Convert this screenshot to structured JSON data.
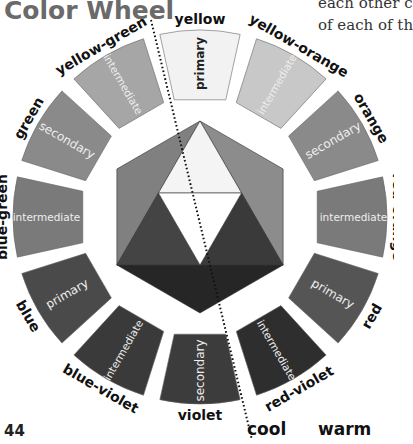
{
  "page": {
    "title": "Color Wheel",
    "corner_text": [
      "each other c",
      "of each of th"
    ],
    "page_number": "44",
    "cool_label": "cool",
    "warm_label": "warm"
  },
  "wheel": {
    "segments": [
      {
        "name": "yellow",
        "type": "primary",
        "fill": "#f2f2f2",
        "text_color": "#222222"
      },
      {
        "name": "yellow-orange",
        "type": "intermediate",
        "fill": "#c8c8c8",
        "text_color": "#eeeeee"
      },
      {
        "name": "orange",
        "type": "secondary",
        "fill": "#8a8a8a",
        "text_color": "#eeeeee"
      },
      {
        "name": "red-orange",
        "type": "intermediate",
        "fill": "#7a7a7a",
        "text_color": "#eeeeee"
      },
      {
        "name": "red",
        "type": "primary",
        "fill": "#555555",
        "text_color": "#eeeeee"
      },
      {
        "name": "red-violet",
        "type": "intermediate",
        "fill": "#2e2e2e",
        "text_color": "#eeeeee"
      },
      {
        "name": "violet",
        "type": "secondary",
        "fill": "#3c3c3c",
        "text_color": "#eeeeee"
      },
      {
        "name": "blue-violet",
        "type": "intermediate",
        "fill": "#3a3a3a",
        "text_color": "#eeeeee"
      },
      {
        "name": "blue",
        "type": "primary",
        "fill": "#4a4a4a",
        "text_color": "#eeeeee"
      },
      {
        "name": "blue-green",
        "type": "intermediate",
        "fill": "#7a7a7a",
        "text_color": "#eeeeee"
      },
      {
        "name": "green",
        "type": "secondary",
        "fill": "#8a8a8a",
        "text_color": "#eeeeee"
      },
      {
        "name": "yellow-green",
        "type": "intermediate",
        "fill": "#a6a6a6",
        "text_color": "#eeeeee"
      }
    ],
    "center": {
      "hexagon_regions": [
        {
          "name": "top",
          "fill": "#e0e0e0"
        },
        {
          "name": "upper-right",
          "fill": "#8c8c8c"
        },
        {
          "name": "lower-right",
          "fill": "#3e3e3e"
        },
        {
          "name": "bottom",
          "fill": "#262626"
        },
        {
          "name": "lower-left",
          "fill": "#4a4a4a"
        },
        {
          "name": "upper-left",
          "fill": "#808080"
        }
      ],
      "inner_triangle": [
        {
          "name": "top",
          "fill": "#f4f4f4"
        },
        {
          "name": "right",
          "fill": "#3a3a3a"
        },
        {
          "name": "left",
          "fill": "#444444"
        },
        {
          "name": "middle",
          "fill": "#ffffff"
        }
      ]
    },
    "divider": {
      "style": "dotted",
      "color": "#111111"
    }
  }
}
